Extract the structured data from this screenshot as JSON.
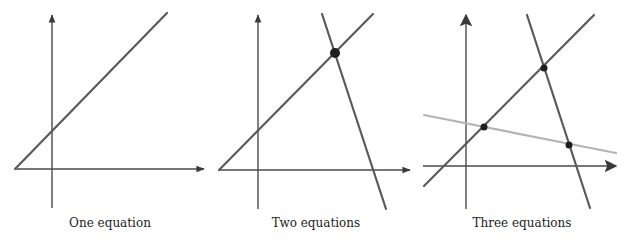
{
  "panels": [
    {
      "caption": "One equation",
      "caption_x": 110,
      "axes": {
        "x_axis": {
          "x1": 15,
          "y": 169,
          "x2": 204
        },
        "y_axis": {
          "x": 52,
          "y1": 208,
          "y2": 15
        }
      },
      "lines": [
        {
          "x1": 15,
          "y1": 169,
          "x2": 167,
          "y2": 13,
          "style": "dark"
        }
      ],
      "points": []
    },
    {
      "caption": "Two equations",
      "caption_x": 316,
      "axes": {
        "x_axis": {
          "x1": 219,
          "y": 170,
          "x2": 410
        },
        "y_axis": {
          "x": 258,
          "y1": 209,
          "y2": 15
        }
      },
      "lines": [
        {
          "x1": 219,
          "y1": 170,
          "x2": 373,
          "y2": 14,
          "style": "dark"
        },
        {
          "x1": 322,
          "y1": 14,
          "x2": 386,
          "y2": 209,
          "style": "dark"
        }
      ],
      "points": [
        {
          "x": 335,
          "y": 53,
          "r": 5
        }
      ]
    },
    {
      "caption": "Three equations",
      "caption_x": 522,
      "axes": {
        "x_axis": {
          "x1": 423,
          "y": 166,
          "x2": 616
        },
        "y_axis": {
          "x": 466,
          "y1": 209,
          "y2": 15
        }
      },
      "lines": [
        {
          "x1": 424,
          "y1": 186,
          "x2": 594,
          "y2": 15,
          "style": "dark"
        },
        {
          "x1": 527,
          "y1": 15,
          "x2": 590,
          "y2": 208,
          "style": "dark"
        },
        {
          "x1": 424,
          "y1": 115,
          "x2": 616,
          "y2": 153,
          "style": "light"
        }
      ],
      "points": [
        {
          "x": 544,
          "y": 68,
          "r": 3.5
        },
        {
          "x": 484,
          "y": 127,
          "r": 3.5
        },
        {
          "x": 569,
          "y": 145,
          "r": 3.5
        }
      ]
    }
  ],
  "colors": {
    "axis": "#4a4a4a",
    "line_dark": "#5a5a5a",
    "line_light": "#b4b4b4",
    "point": "#1e1e1e",
    "background": "#ffffff"
  }
}
